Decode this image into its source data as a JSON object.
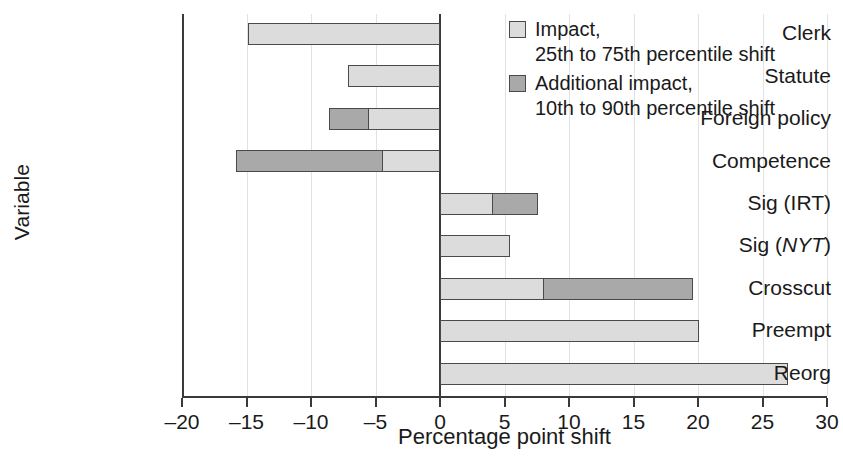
{
  "chart_data": {
    "type": "bar",
    "orientation": "horizontal",
    "title": "",
    "xlabel": "Percentage point shift",
    "ylabel": "Variable",
    "xlim": [
      -20,
      30
    ],
    "xticks": [
      -20,
      -15,
      -10,
      -5,
      0,
      5,
      10,
      15,
      20,
      25,
      30
    ],
    "xtick_labels": [
      "–20",
      "–15",
      "–10",
      "–5",
      "0",
      "5",
      "10",
      "15",
      "20",
      "25",
      "30"
    ],
    "grid": "vertical",
    "legend_position": "top-right",
    "categories": [
      "Clerk",
      "Statute",
      "Foreign policy",
      "Competence",
      "Sig (IRT)",
      "Sig (NYT)",
      "Crosscut",
      "Preempt",
      "Reorg"
    ],
    "category_labels_html": [
      "Clerk",
      "Statute",
      "Foreign policy",
      "Competence",
      "Sig (IRT)",
      "Sig (<i>NYT</i>)",
      "Crosscut",
      "Preempt",
      "Reorg"
    ],
    "series": [
      {
        "name": "Impact, 25th to 75th percentile shift",
        "color": "#dcdcdc",
        "values": [
          -14.9,
          -7.1,
          -5.6,
          -4.5,
          4.1,
          5.4,
          8.1,
          20.1,
          27.0
        ]
      },
      {
        "name": "Additional impact, 10th to 90th percentile shift",
        "color": "#a9a9a9",
        "values": [
          -14.9,
          -7.1,
          -8.6,
          -15.8,
          7.6,
          5.4,
          19.6,
          20.1,
          27.0
        ]
      }
    ],
    "bars": [
      {
        "category": "Clerk",
        "impact": -14.9,
        "total": -14.9
      },
      {
        "category": "Statute",
        "impact": -7.1,
        "total": -7.1
      },
      {
        "category": "Foreign policy",
        "impact": -5.6,
        "total": -8.6
      },
      {
        "category": "Competence",
        "impact": -4.5,
        "total": -15.8
      },
      {
        "category": "Sig (IRT)",
        "impact": 4.1,
        "total": 7.6
      },
      {
        "category": "Sig (NYT)",
        "impact": 5.4,
        "total": 5.4
      },
      {
        "category": "Crosscut",
        "impact": 8.1,
        "total": 19.6
      },
      {
        "category": "Preempt",
        "impact": 20.1,
        "total": 20.1
      },
      {
        "category": "Reorg",
        "impact": 27.0,
        "total": 27.0
      }
    ]
  },
  "legend": {
    "entries": [
      {
        "swatch": "#dcdcdc",
        "label": "Impact,\n25th to 75th percentile shift"
      },
      {
        "swatch": "#a9a9a9",
        "label": "Additional impact,\n10th to 90th percentile shift"
      }
    ]
  },
  "axes": {
    "x_title": "Percentage point shift",
    "y_title": "Variable"
  },
  "colors": {
    "light_gray": "#dcdcdc",
    "dark_gray": "#a9a9a9",
    "outline": "#4a4a4a",
    "axis": "#3a3a3a",
    "gridline": "#e2e2e2",
    "text": "#1a1a1a",
    "background": "#ffffff"
  }
}
